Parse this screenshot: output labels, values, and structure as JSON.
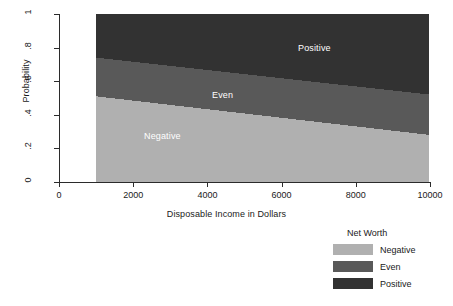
{
  "chart_data": {
    "type": "area",
    "title": "",
    "xlabel": "Disposable Income in Dollars",
    "ylabel": "Probability",
    "xlim": [
      0,
      10000
    ],
    "ylim": [
      0,
      1
    ],
    "grid": false,
    "stacked": true,
    "legend_position": "bottom-right-outside",
    "legend_title": "Net Worth",
    "x": [
      1000,
      10000
    ],
    "series": [
      {
        "name": "Negative",
        "color": "#b0b0b0",
        "values": [
          0.51,
          0.28
        ],
        "cumulative_top": [
          0.51,
          0.28
        ],
        "cumulative_bottom": [
          0.0,
          0.0
        ],
        "in_plot_label": "Negative"
      },
      {
        "name": "Even",
        "color": "#595959",
        "values": [
          0.23,
          0.24
        ],
        "cumulative_top": [
          0.74,
          0.52
        ],
        "cumulative_bottom": [
          0.51,
          0.28
        ],
        "in_plot_label": "Even"
      },
      {
        "name": "Positive",
        "color": "#323232",
        "values": [
          0.26,
          0.48
        ],
        "cumulative_top": [
          1.0,
          1.0
        ],
        "cumulative_bottom": [
          0.74,
          0.52
        ],
        "in_plot_label": "Positive"
      }
    ],
    "xticks": [
      {
        "value": 0,
        "label": "0"
      },
      {
        "value": 2000,
        "label": "2000"
      },
      {
        "value": 4000,
        "label": "4000"
      },
      {
        "value": 6000,
        "label": "6000"
      },
      {
        "value": 8000,
        "label": "8000"
      },
      {
        "value": 10000,
        "label": "10000"
      }
    ],
    "yticks": [
      {
        "value": 0,
        "label": "0"
      },
      {
        "value": 0.2,
        "label": ".2"
      },
      {
        "value": 0.4,
        "label": ".4"
      },
      {
        "value": 0.6,
        "label": ".6"
      },
      {
        "value": 0.8,
        "label": ".8"
      },
      {
        "value": 1,
        "label": "1"
      }
    ]
  },
  "axes": {
    "x_label": "Disposable Income in Dollars",
    "y_label": "Probability"
  },
  "plot_labels": {
    "negative": "Negative",
    "even": "Even",
    "positive": "Positive"
  },
  "legend": {
    "title": "Net Worth",
    "items": [
      {
        "label": "Negative",
        "color": "#b0b0b0"
      },
      {
        "label": "Even",
        "color": "#595959"
      },
      {
        "label": "Positive",
        "color": "#323232"
      }
    ]
  }
}
